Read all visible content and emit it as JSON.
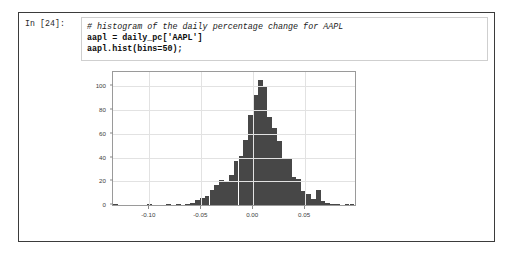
{
  "cell": {
    "prompt": "In [24]:",
    "code_lines": [
      {
        "text": "# histogram of the daily percentage change for AAPL",
        "style": "comment"
      },
      {
        "text": "aapl = daily_pc['AAPL']",
        "style": "stmt"
      },
      {
        "text": "aapl.hist(bins=50);",
        "style": "stmt"
      }
    ]
  },
  "colors": {
    "bar": "#474747",
    "grid": "#e2e2e2",
    "axis": "#9a9a9a",
    "cell_border": "#3b3b3b",
    "input_border": "#cfcfcf",
    "tick_text": "#3d3d3d"
  },
  "chart_data": {
    "type": "bar",
    "title": "",
    "xlabel": "",
    "ylabel": "",
    "bins": 50,
    "grid": true,
    "legend": null,
    "xlim": [
      -0.135,
      0.098
    ],
    "ylim": [
      0,
      112
    ],
    "xticks": [
      -0.1,
      -0.05,
      0.0,
      0.05
    ],
    "xtick_labels": [
      "-0.10",
      "-0.05",
      "0.00",
      "0.05"
    ],
    "yticks": [
      0,
      20,
      40,
      60,
      80,
      100
    ],
    "ytick_labels": [
      "0",
      "20",
      "40",
      "60",
      "80",
      "100"
    ],
    "bin_centers": [
      -0.1327,
      -0.128,
      -0.1234,
      -0.1187,
      -0.1141,
      -0.1094,
      -0.1048,
      -0.1001,
      -0.0955,
      -0.0908,
      -0.0862,
      -0.0815,
      -0.0769,
      -0.0722,
      -0.0676,
      -0.0629,
      -0.0583,
      -0.0536,
      -0.049,
      -0.0443,
      -0.0397,
      -0.035,
      -0.0304,
      -0.0257,
      -0.0211,
      -0.0164,
      -0.0118,
      -0.0071,
      -0.0025,
      0.0022,
      0.0068,
      0.0115,
      0.0161,
      0.0208,
      0.0254,
      0.0301,
      0.0347,
      0.0394,
      0.044,
      0.0487,
      0.0533,
      0.058,
      0.0626,
      0.0673,
      0.0719,
      0.0766,
      0.0812,
      0.0859,
      0.0905,
      0.0952
    ],
    "values": [
      1,
      0,
      0,
      0,
      0,
      0,
      0,
      1,
      0,
      0,
      0,
      1,
      0,
      1,
      0,
      1,
      2,
      4,
      6,
      8,
      13,
      17,
      21,
      20,
      25,
      37,
      41,
      55,
      76,
      93,
      105,
      100,
      74,
      65,
      54,
      40,
      39,
      24,
      22,
      12,
      9,
      5,
      13,
      3,
      2,
      1,
      1,
      0,
      1,
      1
    ],
    "peak_value": 105,
    "peak_bin_center": 0.0068
  }
}
